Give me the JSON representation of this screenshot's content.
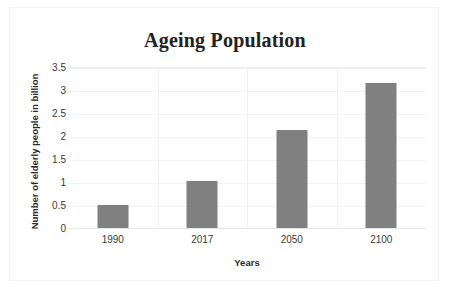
{
  "chart_data": {
    "type": "bar",
    "title": "Ageing Population",
    "xlabel": "Years",
    "ylabel": "Number of elderly people in billion",
    "categories": [
      "1990",
      "2017",
      "2050",
      "2100"
    ],
    "values": [
      0.5,
      1.03,
      2.12,
      3.15
    ],
    "series": [
      {
        "name": "Number of elderly people in billion",
        "values": [
          0.5,
          1.03,
          2.12,
          3.15
        ]
      }
    ],
    "ylim": [
      0,
      3.5
    ],
    "ytick_labels": [
      "0",
      "0.5",
      "1",
      "1.5",
      "2",
      "2.5",
      "3",
      "3.5"
    ],
    "ytick_values": [
      0,
      0.5,
      1,
      1.5,
      2,
      2.5,
      3,
      3.5
    ],
    "grid": true,
    "legend": false,
    "legend_position": "none",
    "bar_color": "#808080",
    "gridline_color": "#f0f2f4",
    "frame_border_color": "#f2f2f2",
    "background_color": "#ffffff",
    "text_color": "#3a3a3a"
  }
}
